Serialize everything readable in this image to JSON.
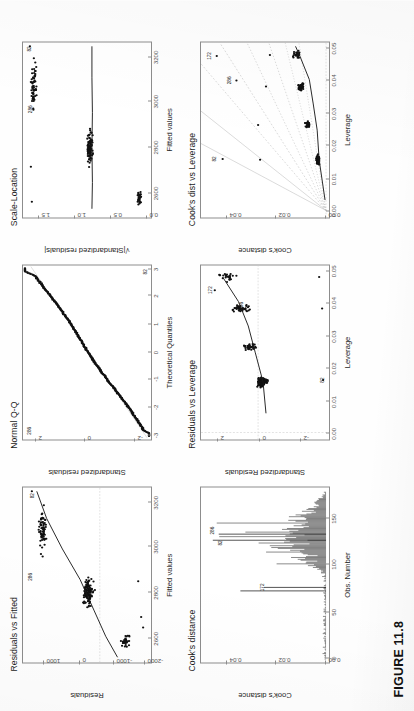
{
  "caption": "FIGURE 11.8",
  "panels": [
    {
      "id": "residuals-vs-fitted",
      "title": "Residuals vs Fitted",
      "xlabel": "Fitted values",
      "ylabel": "Residuals",
      "xticks": [
        "2600",
        "2800",
        "3000",
        "3200"
      ],
      "yticks": [
        "1000",
        "0",
        "-1000",
        "-2000"
      ],
      "point_labels": [
        "286",
        "82"
      ]
    },
    {
      "id": "normal-qq",
      "title": "Normal Q-Q",
      "xlabel": "Theoretical Quantiles",
      "ylabel": "Standardized residuals",
      "xticks": [
        "-3",
        "-2",
        "-1",
        "0",
        "1",
        "2",
        "3"
      ],
      "yticks": [
        "2",
        "0",
        "-2"
      ],
      "point_labels": [
        "286",
        "82"
      ]
    },
    {
      "id": "scale-location",
      "title": "Scale-Location",
      "xlabel": "Fitted values",
      "ylabel": "√|Standardized residuals|",
      "xticks": [
        "2600",
        "2800",
        "3000",
        "3200"
      ],
      "yticks": [
        "1.5",
        "1.0",
        "0.5",
        "0.0"
      ],
      "point_labels": [
        "286",
        "82"
      ]
    },
    {
      "id": "cooks-distance",
      "title": "Cook's distance",
      "xlabel": "Obs. Number",
      "ylabel": "Cook's distance",
      "xticks": [
        "0",
        "50",
        "100",
        "150"
      ],
      "yticks": [
        "0.04",
        "0.02",
        "0.00"
      ],
      "point_labels": [
        "172",
        "82",
        "286"
      ]
    },
    {
      "id": "residuals-vs-leverage",
      "title": "Residuals vs Leverage",
      "xlabel": "Leverage",
      "ylabel": "Standardized Residuals",
      "xticks": [
        "0.00",
        "0.01",
        "0.02",
        "0.03",
        "0.04",
        "0.05"
      ],
      "yticks": [
        "2",
        "0",
        "-2"
      ],
      "point_labels": [
        "172",
        "286",
        "82"
      ]
    },
    {
      "id": "cooks-dist-vs-leverage",
      "title": "Cook's dist vs Leverage",
      "xlabel": "Leverage",
      "ylabel": "Cook's distance",
      "xticks": [
        "0.00",
        "0.01",
        "0.02",
        "0.03",
        "0.04",
        "0.05"
      ],
      "yticks": [
        "0.04",
        "0.02",
        "0.00"
      ],
      "point_labels": [
        "172",
        "286",
        "82"
      ]
    }
  ],
  "chart_data": [
    {
      "type": "scatter",
      "id": "residuals-vs-fitted",
      "title": "Residuals vs Fitted",
      "xlabel": "Fitted values",
      "ylabel": "Residuals",
      "xlim": [
        2480,
        3330
      ],
      "ylim": [
        -2400,
        1500
      ],
      "xticks": [
        2600,
        2800,
        3000,
        3200
      ],
      "yticks": [
        1000,
        0,
        -1000,
        -2000
      ],
      "grid": false,
      "clusters": [
        {
          "x": 2560,
          "n": 30,
          "y_center": 500,
          "y_spread": 450
        },
        {
          "x": 2830,
          "n": 95,
          "y_center": 120,
          "y_spread": 520
        },
        {
          "x": 3120,
          "n": 45,
          "y_center": 900,
          "y_spread": 420
        }
      ],
      "loess": [
        [
          2510,
          -330
        ],
        [
          2700,
          -90
        ],
        [
          2900,
          160
        ],
        [
          3100,
          480
        ],
        [
          3300,
          760
        ]
      ],
      "annotations": [
        {
          "label": "286",
          "x": 3000,
          "y": 1430
        },
        {
          "label": "82",
          "x": 3290,
          "y": 1380
        }
      ]
    },
    {
      "type": "scatter",
      "id": "normal-qq",
      "title": "Normal Q-Q",
      "xlabel": "Theoretical Quantiles",
      "ylabel": "Standardized residuals",
      "xlim": [
        -3.2,
        3.2
      ],
      "ylim": [
        -3.4,
        3.0
      ],
      "xticks": [
        -3,
        -2,
        -1,
        0,
        1,
        2,
        3
      ],
      "yticks": [
        2,
        0,
        -2
      ],
      "grid": false,
      "reference_line": [
        [
          -3.2,
          -3.3
        ],
        [
          3.2,
          2.9
        ]
      ],
      "annotations": [
        {
          "label": "286",
          "x": -2.9,
          "y": 2.6
        },
        {
          "label": "82",
          "x": 2.9,
          "y": -3.1
        }
      ]
    },
    {
      "type": "scatter",
      "id": "scale-location",
      "title": "Scale-Location",
      "xlabel": "Fitted values",
      "ylabel": "sqrt(|Standardized residuals|)",
      "xlim": [
        2480,
        3330
      ],
      "ylim": [
        0.0,
        1.75
      ],
      "xticks": [
        2600,
        2800,
        3000,
        3200
      ],
      "yticks": [
        0.0,
        0.5,
        1.0,
        1.5
      ],
      "grid": false,
      "loess": [
        [
          2510,
          0.72
        ],
        [
          2830,
          0.7
        ],
        [
          3130,
          0.71
        ],
        [
          3300,
          0.71
        ]
      ],
      "annotations": [
        {
          "label": "286",
          "x": 3010,
          "y": 1.62
        },
        {
          "label": "82",
          "x": 3285,
          "y": 1.66
        }
      ]
    },
    {
      "type": "bar",
      "id": "cooks-distance",
      "title": "Cook's distance",
      "xlabel": "Obs. Number",
      "ylabel": "Cook's distance",
      "xlim": [
        0,
        185
      ],
      "ylim": [
        0.0,
        0.052
      ],
      "xticks": [
        0,
        50,
        100,
        150
      ],
      "yticks": [
        0.0,
        0.02,
        0.04
      ],
      "grid": false,
      "annotations": [
        {
          "label": "172",
          "x": 82,
          "y": 0.0262
        },
        {
          "label": "82",
          "x": 131,
          "y": 0.0425
        },
        {
          "label": "286",
          "x": 140,
          "y": 0.0465
        }
      ]
    },
    {
      "type": "scatter",
      "id": "residuals-vs-leverage",
      "title": "Residuals vs Leverage",
      "xlabel": "Leverage",
      "ylabel": "Standardized Residuals",
      "xlim": [
        0.0,
        0.053
      ],
      "ylim": [
        -3.4,
        2.8
      ],
      "xticks": [
        0.0,
        0.01,
        0.02,
        0.03,
        0.04,
        0.05
      ],
      "yticks": [
        2,
        0,
        -2
      ],
      "grid": false,
      "loess": [
        [
          0.005,
          -0.35
        ],
        [
          0.017,
          -0.22
        ],
        [
          0.03,
          0.55
        ],
        [
          0.042,
          0.95
        ],
        [
          0.05,
          1.9
        ]
      ],
      "annotations": [
        {
          "label": "172",
          "x": 0.0455,
          "y": 2.45
        },
        {
          "label": "286",
          "x": 0.0405,
          "y": 1.0
        },
        {
          "label": "82",
          "x": 0.0175,
          "y": -3.15
        }
      ]
    },
    {
      "type": "scatter",
      "id": "cooks-dist-vs-leverage",
      "title": "Cook's dist vs Leverage",
      "xlabel": "Leverage",
      "ylabel": "Cook's distance",
      "xlim": [
        0.0,
        0.053
      ],
      "ylim": [
        0.0,
        0.052
      ],
      "xticks": [
        0.0,
        0.01,
        0.02,
        0.03,
        0.04,
        0.05
      ],
      "yticks": [
        0.0,
        0.02,
        0.04
      ],
      "grid": false,
      "contours": [
        0.5,
        1.0,
        1.5,
        2.0,
        2.5,
        3.0,
        4.0,
        5.0
      ],
      "annotations": [
        {
          "label": "172",
          "x": 0.0488,
          "y": 0.0468
        },
        {
          "label": "286",
          "x": 0.0415,
          "y": 0.0352
        },
        {
          "label": "82",
          "x": 0.0175,
          "y": 0.0438
        }
      ]
    }
  ]
}
